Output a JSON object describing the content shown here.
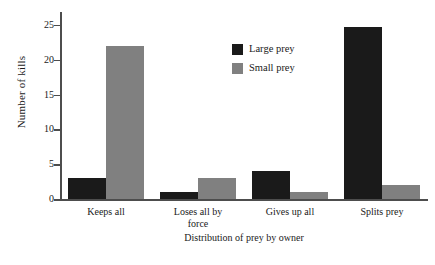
{
  "chart_data": {
    "type": "bar",
    "title": "",
    "xlabel": "Distribution of prey by owner",
    "ylabel": "Number of kills",
    "categories": [
      "Keeps all",
      "Loses all by force",
      "Gives up all",
      "Splits prey"
    ],
    "series": [
      {
        "name": "Large prey",
        "color": "#1a1a1a",
        "values": [
          3,
          1,
          4,
          24.7
        ]
      },
      {
        "name": "Small prey",
        "color": "#808080",
        "values": [
          22,
          3,
          1,
          2
        ]
      }
    ],
    "ylim": [
      0,
      26
    ],
    "yticks": [
      0,
      5,
      10,
      15,
      20,
      25
    ],
    "ytick_labels": [
      "0",
      "5",
      "10",
      "15",
      "20",
      "25"
    ],
    "grid": false,
    "legend_position": "upper center",
    "axis_color": "#4d4d4d",
    "background": "#ffffff"
  },
  "category_lines": [
    [
      "Keeps all"
    ],
    [
      "Loses all by",
      "force"
    ],
    [
      "Gives up all"
    ],
    [
      "Splits prey"
    ]
  ]
}
